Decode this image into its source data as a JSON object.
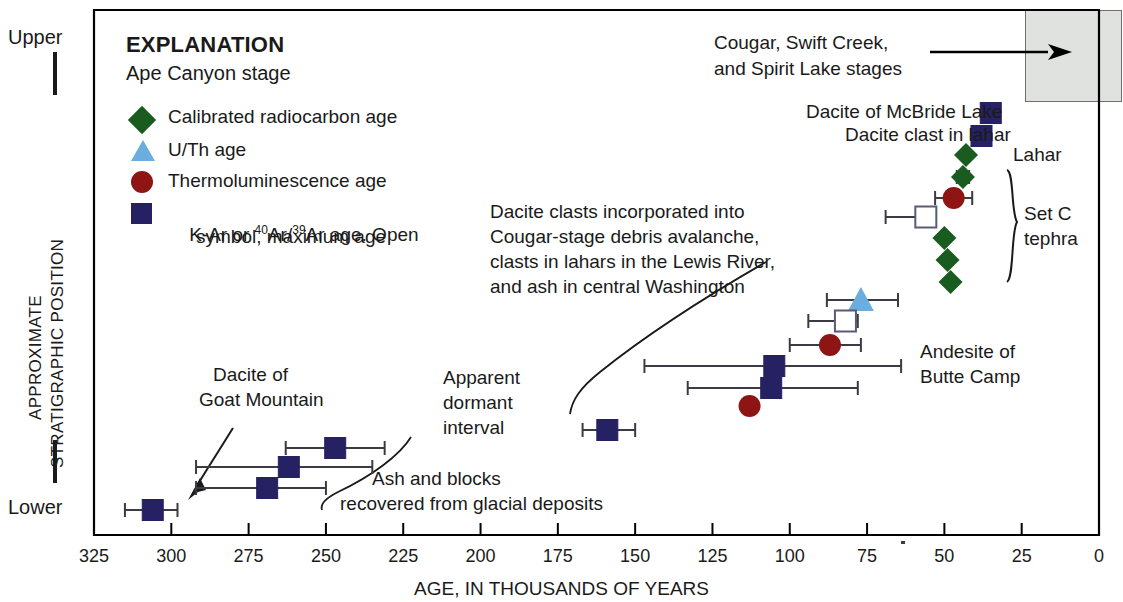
{
  "chart_data": {
    "type": "scatter",
    "title": "",
    "xlabel": "AGE, IN THOUSANDS OF YEARS",
    "ylabel": "APPROXIMATE STRATIGRAPHIC POSITION",
    "xlim": [
      325,
      0
    ],
    "x_axis_reversed": true,
    "xticks": [
      325,
      300,
      275,
      250,
      225,
      200,
      175,
      150,
      125,
      100,
      75,
      50,
      25,
      0
    ],
    "y_axis_kind": "ordinal-relative",
    "y_top_label": "Upper",
    "y_bottom_label": "Lower",
    "grid": false,
    "legend_title": "EXPLANATION",
    "legend_subtitle": "Ape Canyon stage",
    "legend": [
      {
        "symbol": "diamond",
        "color": "#1a5c20",
        "filled": true,
        "label": "Calibrated radiocarbon age"
      },
      {
        "symbol": "triangle",
        "color": "#6aadde",
        "filled": true,
        "label": "U/Th age"
      },
      {
        "symbol": "circle",
        "color": "#8f1414",
        "filled": true,
        "label": "Thermoluminescence age"
      },
      {
        "symbol": "square",
        "color": "#262163",
        "filled": true,
        "label": "K-Ar or 40Ar/39Ar age. Open symbol, maximum age"
      }
    ],
    "points": [
      {
        "id": "mcbride-lake-dacite",
        "symbol": "square",
        "color": "#262163",
        "filled": true,
        "age": 35,
        "ypos": 113,
        "err_low": null,
        "err_high": null,
        "label": "Dacite of McBride Lake"
      },
      {
        "id": "dacite-clast-lahar",
        "symbol": "square",
        "color": "#262163",
        "filled": true,
        "age": 38,
        "ypos": 136,
        "err_low": null,
        "err_high": null,
        "label": "Dacite clast in lahar"
      },
      {
        "id": "lahar-diamond",
        "symbol": "diamond",
        "color": "#1a5c20",
        "filled": true,
        "age": 43,
        "ypos": 155,
        "err_low": null,
        "err_high": null,
        "label": "Lahar"
      },
      {
        "id": "setc-d1",
        "symbol": "diamond",
        "color": "#1a5c20",
        "filled": true,
        "age": 44,
        "ypos": 177,
        "err_low": 46,
        "err_high": 42
      },
      {
        "id": "setc-tl1",
        "symbol": "circle",
        "color": "#8f1414",
        "filled": true,
        "age": 47,
        "ypos": 198,
        "err_low": 53,
        "err_high": 41
      },
      {
        "id": "setc-open-sq",
        "symbol": "square",
        "color": "#262163",
        "filled": false,
        "age": 56,
        "ypos": 217,
        "err_low": 69,
        "err_high": 54
      },
      {
        "id": "setc-d2",
        "symbol": "diamond",
        "color": "#1a5c20",
        "filled": true,
        "age": 50,
        "ypos": 238
      },
      {
        "id": "setc-d3",
        "symbol": "diamond",
        "color": "#1a5c20",
        "filled": true,
        "age": 49,
        "ypos": 260
      },
      {
        "id": "setc-d4",
        "symbol": "diamond",
        "color": "#1a5c20",
        "filled": true,
        "age": 48,
        "ypos": 282
      },
      {
        "id": "uth-age",
        "symbol": "triangle",
        "color": "#6aadde",
        "filled": true,
        "age": 77,
        "ypos": 300,
        "err_low": 88,
        "err_high": 65
      },
      {
        "id": "open-sq-mid",
        "symbol": "square",
        "color": "#262163",
        "filled": false,
        "age": 82,
        "ypos": 321,
        "err_low": 94,
        "err_high": 78
      },
      {
        "id": "tl-mid",
        "symbol": "circle",
        "color": "#8f1414",
        "filled": true,
        "age": 87,
        "ypos": 345,
        "err_low": 100,
        "err_high": 77
      },
      {
        "id": "butte-camp-1",
        "symbol": "square",
        "color": "#262163",
        "filled": true,
        "age": 105,
        "ypos": 366,
        "err_low": 147,
        "err_high": 64
      },
      {
        "id": "butte-camp-2",
        "symbol": "square",
        "color": "#262163",
        "filled": true,
        "age": 106,
        "ypos": 388,
        "err_low": 133,
        "err_high": 78
      },
      {
        "id": "tl-low",
        "symbol": "circle",
        "color": "#8f1414",
        "filled": true,
        "age": 113,
        "ypos": 406
      },
      {
        "id": "sq-160",
        "symbol": "square",
        "color": "#262163",
        "filled": true,
        "age": 159,
        "ypos": 430,
        "err_low": 167,
        "err_high": 150
      },
      {
        "id": "sq-247",
        "symbol": "square",
        "color": "#262163",
        "filled": true,
        "age": 247,
        "ypos": 448,
        "err_low": 263,
        "err_high": 231
      },
      {
        "id": "sq-262",
        "symbol": "square",
        "color": "#262163",
        "filled": true,
        "age": 262,
        "ypos": 467,
        "err_low": 292,
        "err_high": 235
      },
      {
        "id": "sq-269",
        "symbol": "square",
        "color": "#262163",
        "filled": true,
        "age": 269,
        "ypos": 488,
        "err_low": 292,
        "err_high": 250
      },
      {
        "id": "sq-306",
        "symbol": "square",
        "color": "#262163",
        "filled": true,
        "age": 306,
        "ypos": 510,
        "err_low": 315,
        "err_high": 298
      }
    ],
    "annotations": [
      {
        "id": "cougar-stages",
        "text": "Cougar, Swift Creek,\nand Spirit Lake stages",
        "kind": "leader-arrow"
      },
      {
        "id": "dacite-clasts-note",
        "text": "Dacite clasts incorporated into\nCougar-stage debris avalanche,\nclasts in lahars in the Lewis River,\nand ash in central Washington",
        "kind": "leader-curve"
      },
      {
        "id": "set-c-tephra",
        "text": "Set C\ntephra",
        "kind": "brace"
      },
      {
        "id": "andesite-butte-camp",
        "text": "Andesite of\nButte Camp",
        "kind": "label"
      },
      {
        "id": "goat-mountain",
        "text": "Dacite of\nGoat Mountain",
        "kind": "leader-arrow"
      },
      {
        "id": "dormant-interval",
        "text": "Apparent\ndormant\ninterval",
        "kind": "label"
      },
      {
        "id": "ash-blocks",
        "text": "Ash and blocks\nrecovered from glacial deposits",
        "kind": "leader-curve"
      }
    ],
    "shaded_region": {
      "label": "later-stages-box",
      "color": "#dfe2de",
      "x_from": 11,
      "x_to": 0
    }
  },
  "axis": {
    "x_title": "AGE, IN THOUSANDS OF YEARS",
    "y_title_line1": "APPROXIMATE",
    "y_title_line2": "STRATIGRAPHIC POSITION",
    "y_upper": "Upper",
    "y_lower": "Lower",
    "ticks": [
      "325",
      "300",
      "275",
      "250",
      "225",
      "200",
      "175",
      "150",
      "125",
      "100",
      "75",
      "50",
      "25",
      "0"
    ]
  },
  "legend": {
    "title": "EXPLANATION",
    "subtitle": "Ape Canyon stage",
    "items": [
      {
        "label": "Calibrated radiocarbon age"
      },
      {
        "label": "U/Th age"
      },
      {
        "label": "Thermoluminescence age"
      },
      {
        "label": "K-Ar or "
      },
      {
        "label": "Ar age. Open"
      },
      {
        "label": "symbol, maximum age"
      }
    ],
    "sup_40": "40",
    "ar_mid": "Ar/",
    "sup_39": "39"
  },
  "labels": {
    "cougar_l1": "Cougar, Swift Creek,",
    "cougar_l2": "and Spirit Lake stages",
    "mcbride": "Dacite of McBride Lake",
    "dacite_clast": "Dacite clast in lahar",
    "lahar": "Lahar",
    "setc_l1": "Set C",
    "setc_l2": "tephra",
    "clasts_l1": "Dacite clasts incorporated into",
    "clasts_l2": "Cougar-stage debris avalanche,",
    "clasts_l3": "clasts in lahars in the Lewis River,",
    "clasts_l4": "and ash in central Washington",
    "andesite_l1": "Andesite of",
    "andesite_l2": "Butte Camp",
    "goat_l1": "Dacite of",
    "goat_l2": "Goat Mountain",
    "dormant_l1": "Apparent",
    "dormant_l2": "dormant",
    "dormant_l3": "interval",
    "ash_l1": "Ash and blocks",
    "ash_l2": "recovered from glacial deposits"
  },
  "colors": {
    "square": "#262163",
    "diamond": "#1a5c20",
    "circle": "#8f1414",
    "triangle": "#6aadde",
    "box_fill": "#dfe2de",
    "axis": "#000000"
  }
}
